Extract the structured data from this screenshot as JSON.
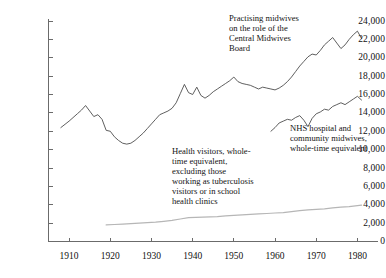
{
  "chart_data": {
    "type": "line",
    "title": "",
    "subtitle": "",
    "xlabel": "",
    "ylabel": "",
    "xlim": [
      1905,
      1985
    ],
    "ylim": [
      0,
      24000
    ],
    "grid": false,
    "legend_position": "inline-annotations",
    "x_ticks": [
      1910,
      1920,
      1930,
      1940,
      1950,
      1960,
      1970,
      1980
    ],
    "x_tick_labels": [
      "1910",
      "1920",
      "1930",
      "1940",
      "1950",
      "1960",
      "1970",
      "1980"
    ],
    "y_ticks": [
      0,
      2000,
      4000,
      6000,
      8000,
      10000,
      12000,
      14000,
      16000,
      18000,
      20000,
      22000,
      24000
    ],
    "y_tick_labels": [
      "0",
      "2,000",
      "4,000",
      "6,000",
      "8,000",
      "10,000",
      "12,000",
      "14,000",
      "16,000",
      "18,000",
      "20,000",
      "22,000",
      "24,000"
    ],
    "series": [
      {
        "name": "Practising midwives on the role of the Central Midwives Board",
        "color": "#4d4d4d",
        "x": [
          1908,
          1910,
          1912,
          1913,
          1914,
          1915,
          1916,
          1917,
          1918,
          1919,
          1920,
          1921,
          1922,
          1923,
          1924,
          1925,
          1926,
          1927,
          1928,
          1929,
          1930,
          1931,
          1932,
          1933,
          1934,
          1935,
          1936,
          1937,
          1938,
          1939,
          1940,
          1941,
          1942,
          1943,
          1944,
          1945,
          1946,
          1947,
          1948,
          1949,
          1950,
          1951,
          1952,
          1953,
          1954,
          1955,
          1956,
          1957,
          1958,
          1959,
          1960,
          1961,
          1962,
          1963,
          1964,
          1965,
          1966,
          1967,
          1968,
          1969,
          1970,
          1971,
          1972,
          1973,
          1974,
          1975,
          1976,
          1977,
          1978,
          1979,
          1980,
          1981
        ],
        "y": [
          12400,
          13100,
          13900,
          14300,
          14800,
          14200,
          13600,
          13800,
          13300,
          12100,
          12000,
          11400,
          11000,
          10700,
          10600,
          10700,
          11000,
          11400,
          11800,
          12300,
          12800,
          13300,
          13800,
          14000,
          14200,
          14500,
          15100,
          16100,
          17100,
          16200,
          16000,
          16800,
          15900,
          15600,
          15900,
          16300,
          16600,
          16900,
          17200,
          17500,
          17900,
          17400,
          17200,
          17100,
          17000,
          16800,
          16600,
          16800,
          16700,
          16600,
          16500,
          16700,
          17000,
          17400,
          17900,
          18500,
          19100,
          19600,
          20100,
          20400,
          20300,
          20800,
          21400,
          21800,
          22200,
          21600,
          21000,
          21400,
          22000,
          22500,
          22900,
          22100
        ],
        "note": "Practising midwives\non the role of the\nCentral Midwives\nBoard"
      },
      {
        "name": "Health visitors, whole-time equivalent, excluding those working as tuberculosis visitors or in school health clinics",
        "color": "#b6b6b6",
        "x": [
          1919,
          1921,
          1923,
          1925,
          1927,
          1929,
          1931,
          1933,
          1935,
          1937,
          1939,
          1946,
          1948,
          1950,
          1952,
          1954,
          1956,
          1958,
          1960,
          1962,
          1964,
          1966,
          1968,
          1970,
          1972,
          1974,
          1976,
          1978,
          1980,
          1981
        ],
        "y": [
          1800,
          1850,
          1900,
          1950,
          2000,
          2050,
          2100,
          2200,
          2300,
          2450,
          2600,
          2700,
          2800,
          2850,
          2900,
          2950,
          3000,
          3050,
          3100,
          3150,
          3250,
          3350,
          3450,
          3500,
          3550,
          3650,
          3750,
          3800,
          3900,
          3950
        ],
        "note": "Health visitors, whole-\ntime equivalent,\nexcluding those\nworking as tuberculosis\nvisitors or in school\nhealth clinics"
      },
      {
        "name": "NHS hospital and community midwives, whole-time equivalent",
        "color": "#4d4d4d",
        "x": [
          1959,
          1960,
          1961,
          1962,
          1963,
          1964,
          1965,
          1966,
          1967,
          1968,
          1969,
          1970,
          1971,
          1972,
          1973,
          1974,
          1975,
          1976,
          1977,
          1978,
          1979,
          1980,
          1981
        ],
        "y": [
          12000,
          12400,
          12900,
          13100,
          13300,
          13200,
          13500,
          13700,
          13200,
          12500,
          13400,
          13900,
          14100,
          14400,
          14300,
          14700,
          14900,
          15100,
          14900,
          15200,
          15500,
          15800,
          15400
        ],
        "note": "NHS hospital and\ncommunity midwives,\nwhole-time equivalent"
      }
    ]
  },
  "annotations": {
    "practising_midwives": "Practising midwives\non the role of the\nCentral Midwives\nBoard",
    "health_visitors": "Health visitors, whole-\ntime equivalent,\nexcluding those\nworking as tuberculosis\nvisitors or in school\nhealth clinics",
    "nhs_midwives": "NHS hospital and\ncommunity midwives,\nwhole-time equivalent"
  },
  "colors": {
    "axis": "#6b6b6b",
    "series_dark": "#4d4d4d",
    "series_light": "#b6b6b6",
    "text": "#141414",
    "background": "#ffffff"
  }
}
